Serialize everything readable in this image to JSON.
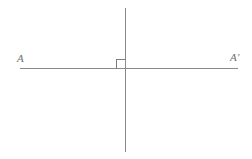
{
  "figure": {
    "kind": "geometry-diagram",
    "canvas": {
      "width": 252,
      "height": 159,
      "background_color": "#ffffff"
    },
    "stroke": {
      "color": "#8a8a8a",
      "width": 1,
      "marker_color": "#7d7d7d",
      "marker_width": 1
    },
    "labels": {
      "left": "A",
      "right": "A′",
      "color": "#6f6f6f",
      "font_size_px": 11,
      "style": "italic-serif"
    },
    "elements": {
      "horizontal_line": {
        "name": "line-AA-prime",
        "x1": 20,
        "y1": 68.5,
        "x2": 238,
        "y2": 68.5
      },
      "vertical_line": {
        "name": "perpendicular-line",
        "x1": 125.5,
        "y1": 8,
        "x2": 125.5,
        "y2": 152
      },
      "intersection_point": {
        "x": 125.5,
        "y": 68.5
      },
      "right_angle_marker": {
        "name": "right-angle-square",
        "quadrant": "upper-left",
        "x": 116.5,
        "y": 59.5,
        "size": 9,
        "angle_degrees": 90
      },
      "label_left_position": {
        "x": 17,
        "y": 53
      },
      "label_right_position": {
        "x": 230,
        "y": 52
      }
    }
  }
}
